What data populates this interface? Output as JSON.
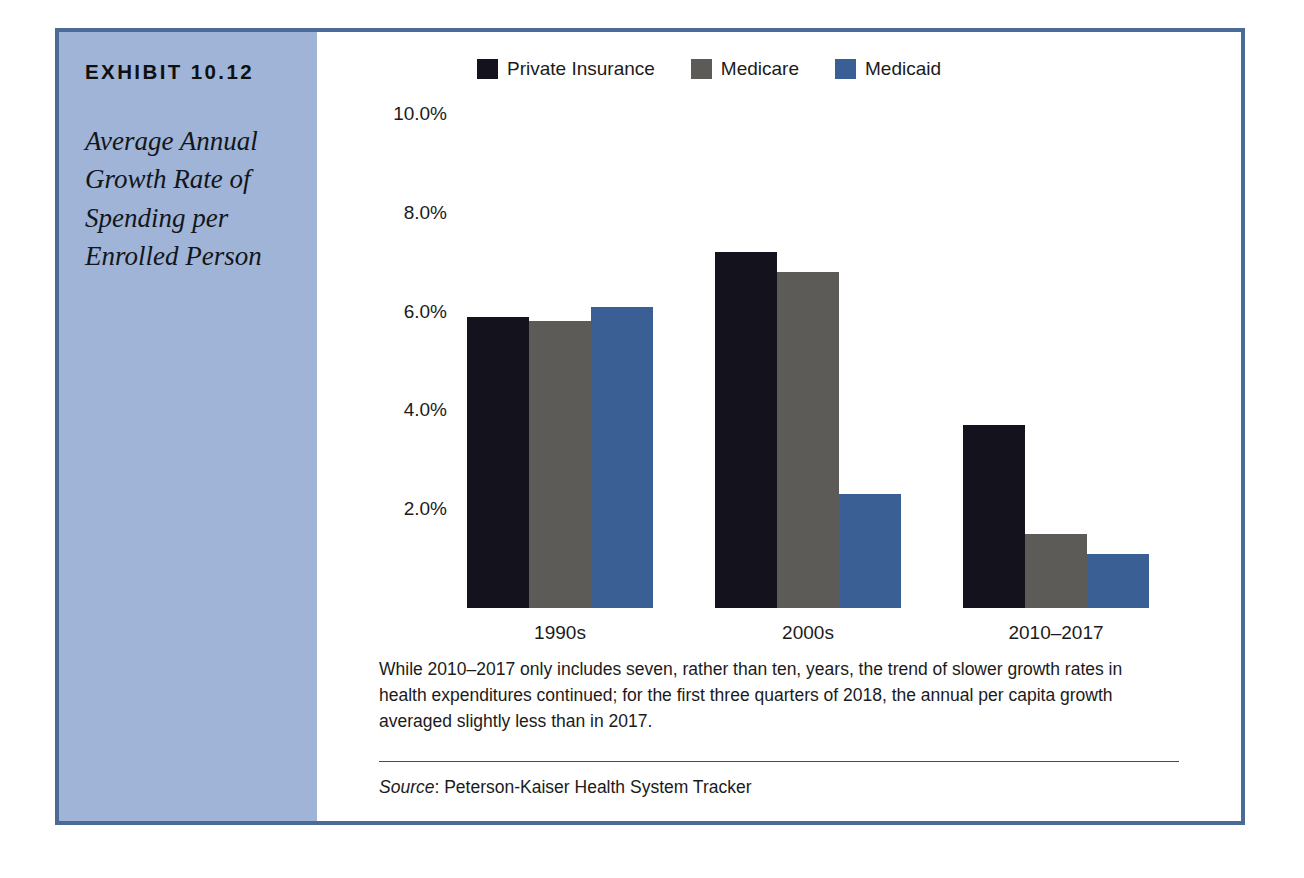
{
  "exhibit": {
    "number": "EXHIBIT 10.12",
    "title": "Average Annual Growth Rate of Spending per Enrolled Person"
  },
  "note": "While 2010–2017 only includes seven, rather than ten, years, the trend of slower growth rates in health expenditures continued; for the first three quarters of 2018, the annual per capita growth averaged slightly less than in 2017.",
  "source": {
    "label": "Source",
    "text": ": Peterson-Kaiser Health System Tracker"
  },
  "colors": {
    "frame_border": "#4a6b96",
    "sidebar_background": "#9fb4d6",
    "private_insurance": "#14121c",
    "medicare": "#5d5b58",
    "medicaid": "#3a5f94"
  },
  "chart_data": {
    "type": "bar",
    "title": "Average Annual Growth Rate of Spending per Enrolled Person",
    "xlabel": "",
    "ylabel": "",
    "categories": [
      "1990s",
      "2000s",
      "2010–2017"
    ],
    "series": [
      {
        "name": "Private Insurance",
        "color": "#14121c",
        "values": [
          5.9,
          7.2,
          3.7
        ]
      },
      {
        "name": "Medicare",
        "color": "#5d5b58",
        "values": [
          5.8,
          6.8,
          1.5
        ]
      },
      {
        "name": "Medicaid",
        "color": "#3a5f94",
        "values": [
          6.1,
          2.3,
          1.1
        ]
      }
    ],
    "ylim": [
      0,
      10
    ],
    "yticks": [
      2,
      4,
      6,
      8,
      10
    ],
    "ytick_labels": [
      "2.0%",
      "4.0%",
      "6.0%",
      "8.0%",
      "10.0%"
    ],
    "grid": false,
    "legend_position": "top"
  }
}
